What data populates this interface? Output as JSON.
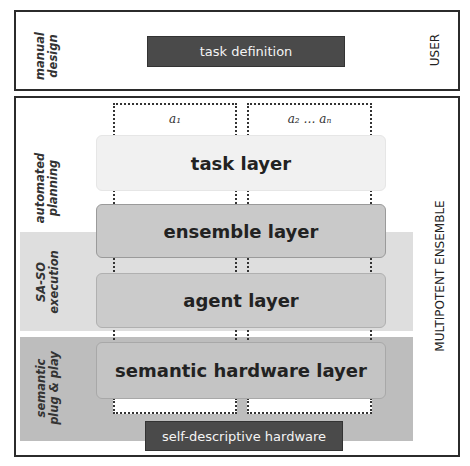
{
  "user_section": {
    "side_label": [
      "manual",
      "design"
    ],
    "task_definition": "task definition",
    "right_label": "USER"
  },
  "ensemble_section": {
    "right_label": "MULTIPOTENT ENSEMBLE",
    "agent_columns": [
      "a₁",
      "a₂ … aₙ"
    ],
    "phase_labels": {
      "planning": [
        "automated",
        "planning"
      ],
      "execution": [
        "SA-SO",
        "execution"
      ],
      "plugplay": [
        "semantic",
        "plug & play"
      ]
    },
    "layers": {
      "task": "task layer",
      "ensemble": "ensemble layer",
      "agent": "agent layer",
      "hardware": "semantic hardware layer"
    },
    "hardware_bar": "self-descriptive hardware"
  },
  "colors": {
    "dark_bar": "#4a4a4a",
    "band_light": "#dedede",
    "band_dark": "#bdbdbd",
    "task_layer": "#f1f1f1",
    "other_layers": "#c9c9c9"
  }
}
